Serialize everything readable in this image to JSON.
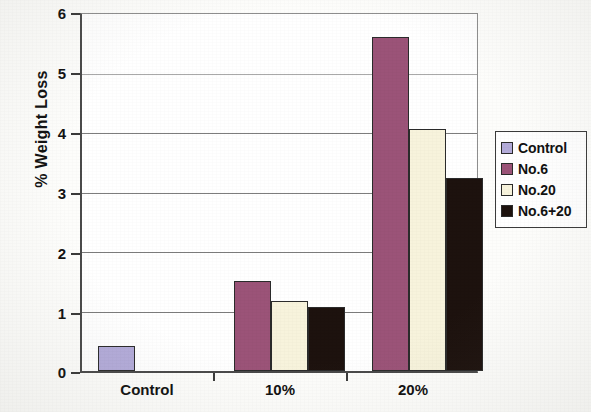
{
  "chart_data": {
    "type": "bar",
    "title": "",
    "xlabel": "",
    "ylabel": "% Weight Loss",
    "categories": [
      "Control",
      "10%",
      "20%"
    ],
    "ylim": [
      0,
      6
    ],
    "yticks": [
      0,
      1,
      2,
      3,
      4,
      5,
      6
    ],
    "ytick_labels": [
      "0",
      "1",
      "2",
      "3",
      "4",
      "5",
      "6"
    ],
    "grid": true,
    "grid_axis": "y",
    "legend_position": "right",
    "series": [
      {
        "name": "Control",
        "color": "#b3abd9",
        "values": [
          0.42,
          null,
          null
        ]
      },
      {
        "name": "No.6",
        "color": "#9b5378",
        "values": [
          null,
          1.52,
          5.62
        ]
      },
      {
        "name": "No.20",
        "color": "#f7f3dc",
        "values": [
          null,
          1.18,
          4.07
        ]
      },
      {
        "name": "No.6+20",
        "color": "#1d120e",
        "values": [
          null,
          1.07,
          3.24
        ]
      }
    ]
  },
  "axis": {
    "ylabel": "% Weight Loss",
    "ytick_labels": [
      "6",
      "5",
      "4",
      "3",
      "2",
      "1",
      "0"
    ],
    "xtick_labels": [
      "Control",
      "10%",
      "20%"
    ]
  },
  "legend": {
    "items": [
      {
        "label": "Control",
        "color": "#b3abd9"
      },
      {
        "label": "No.6",
        "color": "#9b5378"
      },
      {
        "label": "No.20",
        "color": "#f7f3dc"
      },
      {
        "label": "No.6+20",
        "color": "#1d120e"
      }
    ]
  }
}
